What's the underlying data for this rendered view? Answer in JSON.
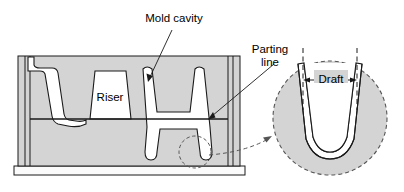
{
  "figure": {
    "title": "",
    "type": "engineering-cross-section-diagram"
  },
  "labels": {
    "mold_cavity": "Mold cavity",
    "riser": "Riser",
    "parting_line_1": "Parting",
    "parting_line_2": "line",
    "draft": "Draft"
  },
  "colors": {
    "mold_fill": "#d4d4d4",
    "cavity_fill": "#ffffff",
    "outline": "#1a1a1a",
    "text": "#000000",
    "dashed": "#555555",
    "base_fill": "#f2f2f2"
  },
  "geometry": {
    "mold_body": {
      "x": 18,
      "y": 56,
      "width": 222,
      "height": 110
    },
    "parting_line_y": 119,
    "base_plate": {
      "x": 14,
      "y": 166,
      "width": 230,
      "height": 9
    },
    "detail_circle": {
      "cx": 330,
      "cy": 118,
      "r": 57
    },
    "marker_circle": {
      "cx": 195,
      "cy": 152,
      "r": 16
    }
  }
}
